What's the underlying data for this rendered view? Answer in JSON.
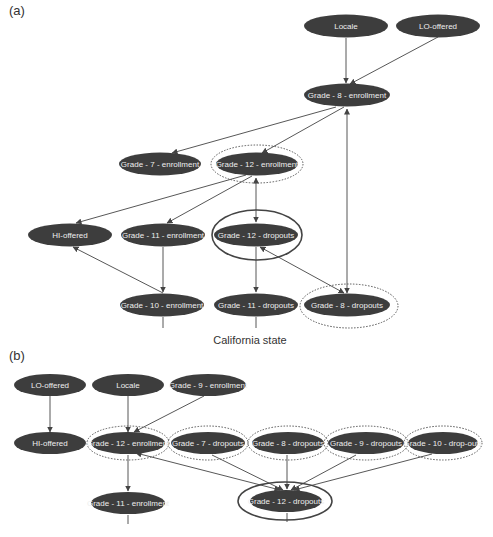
{
  "panels": {
    "a": {
      "label": "(a)",
      "caption": "California state",
      "nodes": {
        "locale": "Locale",
        "lo_offered": "LO-offered",
        "g8_enroll": "Grade - 8 - enrollment",
        "g7_enroll": "Grade - 7 - enrollment",
        "g12_enroll": "Grade - 12 - enrollment",
        "hi_offered": "HI-offered",
        "g11_enroll": "Grade - 11 - enrollment",
        "g12_drop": "Grade - 12 - dropouts",
        "g10_enroll": "Grade - 10 - enrollment",
        "g11_drop": "Grade - 11 - dropouts",
        "g8_drop": "Grade - 8 - dropouts"
      },
      "edges": [
        {
          "from": "Locale",
          "to": "Grade-8-enrollment",
          "type": "directed"
        },
        {
          "from": "LO-offered",
          "to": "Grade-8-enrollment",
          "type": "directed"
        },
        {
          "from": "Grade-8-enrollment",
          "to": "Grade-7-enrollment",
          "type": "directed"
        },
        {
          "from": "Grade-8-enrollment",
          "to": "Grade-12-enrollment",
          "type": "directed"
        },
        {
          "from": "Grade-8-enrollment",
          "to": "Grade-8-dropouts",
          "type": "bidirected"
        },
        {
          "from": "Grade-12-enrollment",
          "to": "HI-offered",
          "type": "directed"
        },
        {
          "from": "Grade-12-enrollment",
          "to": "Grade-11-enrollment",
          "type": "directed"
        },
        {
          "from": "Grade-12-enrollment",
          "to": "Grade-12-dropouts",
          "type": "bidirected"
        },
        {
          "from": "Grade-11-enrollment",
          "to": "Grade-10-enrollment",
          "type": "directed"
        },
        {
          "from": "Grade-10-enrollment",
          "to": "HI-offered",
          "type": "directed"
        },
        {
          "from": "Grade-12-dropouts",
          "to": "Grade-11-dropouts",
          "type": "directed"
        },
        {
          "from": "Grade-12-dropouts",
          "to": "Grade-8-dropouts",
          "type": "bidirected"
        }
      ],
      "highlighted": {
        "solid_ring": [
          "Grade-12-dropouts"
        ],
        "dotted_ring": [
          "Grade-12-enrollment",
          "Grade-8-dropouts"
        ]
      }
    },
    "b": {
      "label": "(b)",
      "nodes": {
        "lo_offered": "LO-offered",
        "locale": "Locale",
        "g9_enroll": "Grade - 9 - enrollment",
        "hi_offered": "HI-offered",
        "g12_enroll": "Grade - 12 - enrollment",
        "g7_drop": "Grade - 7 - dropouts",
        "g8_drop": "Grade - 8 - dropouts",
        "g9_drop": "Grade - 9 - dropouts",
        "g10_drop": "Grade - 10 - drop-outs",
        "g11_enroll": "Grade - 11 - enrollment",
        "g12_drop": "Grade - 12 - dropouts"
      },
      "edges": [
        {
          "from": "LO-offered",
          "to": "HI-offered",
          "type": "directed"
        },
        {
          "from": "Locale",
          "to": "Grade-12-enrollment",
          "type": "directed"
        },
        {
          "from": "Grade-9-enrollment",
          "to": "Grade-12-enrollment",
          "type": "directed"
        },
        {
          "from": "Grade-12-enrollment",
          "to": "Grade-11-enrollment",
          "type": "directed"
        },
        {
          "from": "Grade-12-enrollment",
          "to": "Grade-12-dropouts",
          "type": "bidirected"
        },
        {
          "from": "Grade-7-dropouts",
          "to": "Grade-12-dropouts",
          "type": "directed"
        },
        {
          "from": "Grade-8-dropouts",
          "to": "Grade-12-dropouts",
          "type": "directed"
        },
        {
          "from": "Grade-9-dropouts",
          "to": "Grade-12-dropouts",
          "type": "directed"
        },
        {
          "from": "Grade-10-drop-outs",
          "to": "Grade-12-dropouts",
          "type": "directed"
        }
      ],
      "highlighted": {
        "solid_ring": [
          "Grade-12-dropouts"
        ],
        "dotted_ring": [
          "Grade-12-enrollment",
          "Grade-7-dropouts",
          "Grade-8-dropouts",
          "Grade-9-dropouts",
          "Grade-10-drop-outs"
        ]
      }
    }
  },
  "colors": {
    "node_fill": "#3d3d3d",
    "node_text": "#eeeeee",
    "edge": "#444444",
    "background": "#ffffff"
  }
}
